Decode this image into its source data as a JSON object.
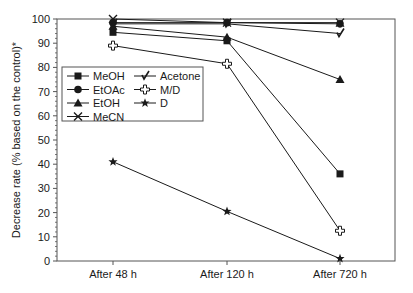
{
  "chart_data": {
    "type": "line",
    "title": "",
    "xlabel": "",
    "ylabel": "Decrease rate (% based on the control)*",
    "categories": [
      "After 48 h",
      "After 120 h",
      "After 720 h"
    ],
    "ylim": [
      0,
      100
    ],
    "yticks": [
      0,
      10,
      20,
      30,
      40,
      50,
      60,
      70,
      80,
      90,
      100
    ],
    "grid": false,
    "legend_position": "upper-left (inside plot, below top)",
    "series": [
      {
        "name": "MeOH",
        "marker": "square-filled",
        "values": [
          94.5,
          91,
          36
        ]
      },
      {
        "name": "EtOAc",
        "marker": "circle-filled",
        "values": [
          98.5,
          98.5,
          98
        ]
      },
      {
        "name": "EtOH",
        "marker": "triangle-filled",
        "values": [
          97,
          92.5,
          75
        ]
      },
      {
        "name": "MeCN",
        "marker": "x-cross",
        "values": [
          100,
          98.5,
          98.5
        ]
      },
      {
        "name": "Acetone",
        "marker": "checkmark",
        "values": [
          98,
          98,
          94
        ]
      },
      {
        "name": "M/D",
        "marker": "open-cross",
        "values": [
          89,
          81.5,
          12.5
        ]
      },
      {
        "name": "D",
        "marker": "star-filled",
        "values": [
          41,
          20.5,
          1
        ]
      }
    ]
  },
  "legend": {
    "col1": [
      "MeOH",
      "EtOAc",
      "EtOH",
      "MeCN"
    ],
    "col2": [
      "Acetone",
      "M/D",
      "D"
    ]
  },
  "colors": {
    "line": "#1a1a1a",
    "axis": "#555555",
    "background": "#ffffff"
  }
}
